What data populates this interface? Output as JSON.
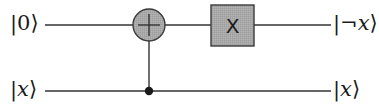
{
  "diagram": {
    "type": "quantum-circuit",
    "wires": [
      {
        "id": "qubit-0",
        "input_label": {
          "bar": "|",
          "content": "0",
          "close": "⟩",
          "italic": false
        },
        "output_label": {
          "bar": "|",
          "content": "¬x",
          "close": "⟩",
          "italic": true
        }
      },
      {
        "id": "qubit-x",
        "input_label": {
          "bar": "|",
          "content": "x",
          "close": "⟩",
          "italic": true
        },
        "output_label": {
          "bar": "|",
          "content": "x",
          "close": "⟩",
          "italic": true
        }
      }
    ],
    "gates": [
      {
        "type": "CNOT",
        "target_wire": 0,
        "control_wire": 1,
        "target_symbol": "+"
      },
      {
        "type": "X",
        "wire": 0,
        "label": "X"
      }
    ],
    "colors": {
      "wire": "#333333",
      "gate_fill": "#a8a8a8",
      "gate_stroke": "#3a3a3a",
      "control_dot": "#1a1a1a",
      "text": "#1a1a1a"
    }
  }
}
